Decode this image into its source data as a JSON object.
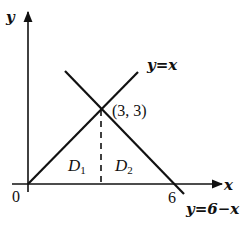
{
  "diagram": {
    "axes": {
      "x_label": "x",
      "y_label": "y",
      "origin_label": "0",
      "x_tick_label": "6"
    },
    "lines": [
      {
        "name": "y=x",
        "label": "y=x"
      },
      {
        "name": "y=6-x",
        "label": "y=6−x"
      }
    ],
    "intersection": {
      "label": "(3, 3)",
      "x": 3,
      "y": 3
    },
    "regions": [
      {
        "name": "D1",
        "main": "D",
        "sub": "1"
      },
      {
        "name": "D2",
        "main": "D",
        "sub": "2"
      }
    ],
    "colors": {
      "stroke": "#111111",
      "background": "#ffffff"
    }
  }
}
